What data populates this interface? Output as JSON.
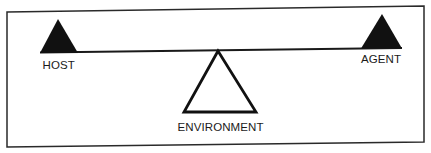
{
  "diagram": {
    "type": "seesaw-balance",
    "colors": {
      "background": "#ffffff",
      "ink": "#1a1a1a"
    },
    "labels": {
      "left_weight": "HOST",
      "right_weight": "AGENT",
      "fulcrum": "ENVIRONMENT"
    }
  }
}
